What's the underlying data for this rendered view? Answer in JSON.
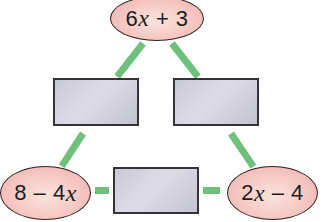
{
  "diagram": {
    "type": "arithmagon",
    "colors": {
      "node_fill": "#f6c7c2",
      "node_border": "#2a2020",
      "box_fill": "#d2d1de",
      "box_border": "#333338",
      "connector": "#6fc07a"
    },
    "nodes": {
      "top": {
        "pre": "6",
        "var": "x",
        "post": " + 3"
      },
      "left": {
        "pre": "8 – 4",
        "var": "x",
        "post": ""
      },
      "right": {
        "pre": "2",
        "var": "x",
        "post": " – 4"
      }
    },
    "boxes": {
      "top_left": "",
      "top_right": "",
      "bottom": ""
    }
  }
}
